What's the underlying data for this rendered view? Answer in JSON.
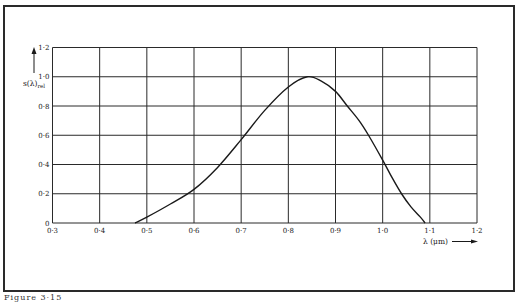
{
  "caption": "Figure 3·15",
  "chart_data": {
    "type": "line",
    "title": "",
    "xlabel": "λ (μm)",
    "ylabel": "s(λ)rel",
    "ylabel_main": "s(λ)",
    "ylabel_sub": "rel",
    "xlim": [
      0.3,
      1.2
    ],
    "ylim": [
      0,
      1.2
    ],
    "grid": true,
    "legend": null,
    "x_ticks": [
      0.3,
      0.4,
      0.5,
      0.6,
      0.7,
      0.8,
      0.9,
      1.0,
      1.1,
      1.2
    ],
    "x_tick_labels": [
      "0·3",
      "0·4",
      "0·5",
      "0·6",
      "0·7",
      "0·8",
      "0·9",
      "1·0",
      "1·1",
      "1·2"
    ],
    "y_ticks": [
      0,
      0.2,
      0.4,
      0.6,
      0.8,
      1.0,
      1.2
    ],
    "y_tick_labels": [
      "0",
      "0·2",
      "0·4",
      "0·6",
      "0·8",
      "1·0",
      "1·2"
    ],
    "series": [
      {
        "name": "relative spectral sensitivity",
        "x": [
          0.475,
          0.5,
          0.55,
          0.6,
          0.65,
          0.7,
          0.75,
          0.8,
          0.84,
          0.87,
          0.9,
          0.925,
          0.95,
          0.97,
          1.0,
          1.02,
          1.04,
          1.06,
          1.08,
          1.09
        ],
        "values": [
          0.0,
          0.04,
          0.13,
          0.23,
          0.38,
          0.57,
          0.77,
          0.93,
          1.0,
          0.97,
          0.9,
          0.8,
          0.7,
          0.6,
          0.43,
          0.31,
          0.2,
          0.11,
          0.04,
          0.0
        ]
      }
    ]
  }
}
